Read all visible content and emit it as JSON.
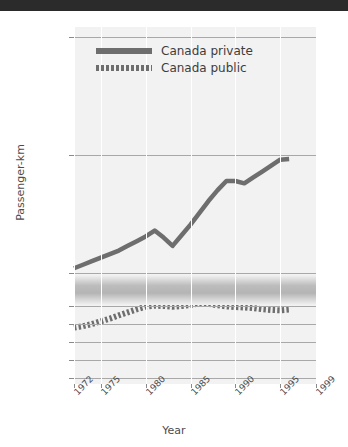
{
  "window": {
    "title_bar_text": "",
    "title_bar_color": "#2b2b2b"
  },
  "chart_data": {
    "type": "line",
    "title": "",
    "xlabel": "Year",
    "ylabel": "Passenger-km",
    "grid": true,
    "legend_position": "top-left-inside",
    "broken_axis": true,
    "axis_note": "y-axis has a break between 400 and 5000",
    "x": [
      1972,
      1975,
      1980,
      1985,
      1990,
      1995,
      1999
    ],
    "xticklabels": [
      "1972",
      "1975",
      "1980",
      "1985",
      "1990",
      "1995",
      "1999"
    ],
    "xlim": [
      1972,
      1999
    ],
    "y_upper_ticks": [
      5000,
      10000,
      15000
    ],
    "y_upper_ticklabels": [
      "5 000",
      "10 000",
      "15 000"
    ],
    "y_upper_lim": [
      5000,
      15000
    ],
    "y_lower_ticks": [
      0,
      100,
      200,
      300,
      400
    ],
    "y_lower_ticklabels": [
      "0",
      "100",
      "200",
      "300",
      "400"
    ],
    "y_lower_lim": [
      0,
      400
    ],
    "series": [
      {
        "name": "Canada private",
        "style": "solid",
        "color": "#6e6e6e",
        "axis": "upper",
        "x": [
          1972,
          1973,
          1974,
          1975,
          1976,
          1977,
          1978,
          1979,
          1980,
          1981,
          1982,
          1983,
          1984,
          1985,
          1986,
          1987,
          1988,
          1989,
          1990,
          1991,
          1992,
          1993,
          1994,
          1995,
          1996
        ],
        "values": [
          5200,
          5350,
          5500,
          5650,
          5800,
          5950,
          6150,
          6350,
          6550,
          6800,
          6500,
          6150,
          6600,
          7050,
          7550,
          8050,
          8500,
          8900,
          8900,
          8800,
          9050,
          9300,
          9550,
          9800,
          9830
        ]
      },
      {
        "name": "Canada public",
        "style": "dotted",
        "color": "#6e6e6e",
        "axis": "lower",
        "x": [
          1972,
          1973,
          1974,
          1975,
          1976,
          1977,
          1978,
          1979,
          1980,
          1981,
          1982,
          1983,
          1984,
          1985,
          1986,
          1987,
          1988,
          1989,
          1990,
          1991,
          1992,
          1993,
          1994,
          1995,
          1996
        ],
        "values": [
          280,
          288,
          300,
          315,
          330,
          348,
          365,
          382,
          396,
          402,
          400,
          396,
          400,
          406,
          414,
          412,
          404,
          398,
          394,
          392,
          388,
          382,
          378,
          376,
          380
        ]
      }
    ]
  }
}
